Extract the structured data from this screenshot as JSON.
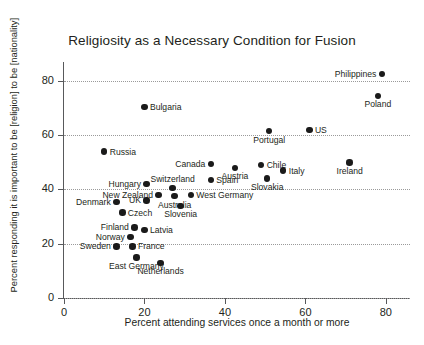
{
  "chart_data": {
    "type": "scatter",
    "title": "Religiosity as a Necessary Condition for Fusion",
    "xlabel": "Percent attending services once a month or more",
    "ylabel": "Percent responding it is important to be [religion] to be [nationality]",
    "xlim": [
      0,
      86
    ],
    "ylim": [
      0,
      87
    ],
    "xticks": [
      0,
      20,
      40,
      60,
      80
    ],
    "yticks": [
      0,
      20,
      40,
      60,
      80
    ],
    "xtick_labels": [
      "0",
      "20",
      "40",
      "60",
      "80"
    ],
    "ytick_labels": [
      "0",
      "20",
      "40",
      "60",
      "80"
    ],
    "grid": "horizontal-dotted",
    "legend": "none",
    "points": [
      {
        "label": "Philippines",
        "x": 79.0,
        "y": 82.5,
        "pos": "left"
      },
      {
        "label": "Poland",
        "x": 78.0,
        "y": 74.5,
        "pos": "below"
      },
      {
        "label": "Bulgaria",
        "x": 20.0,
        "y": 70.5,
        "pos": "right"
      },
      {
        "label": "US",
        "x": 61.0,
        "y": 62.0,
        "pos": "right"
      },
      {
        "label": "Portugal",
        "x": 51.0,
        "y": 61.5,
        "pos": "below"
      },
      {
        "label": "Russia",
        "x": 10.0,
        "y": 54.0,
        "pos": "right"
      },
      {
        "label": "Canada",
        "x": 36.5,
        "y": 49.5,
        "pos": "left"
      },
      {
        "label": "Austria",
        "x": 42.5,
        "y": 48.0,
        "pos": "below"
      },
      {
        "label": "Chile",
        "x": 49.0,
        "y": 49.0,
        "pos": "right"
      },
      {
        "label": "Italy",
        "x": 54.5,
        "y": 47.0,
        "pos": "right"
      },
      {
        "label": "Ireland",
        "x": 71.0,
        "y": 50.0,
        "pos": "below"
      },
      {
        "label": "Slovakia",
        "x": 50.5,
        "y": 44.0,
        "pos": "below"
      },
      {
        "label": "Spain",
        "x": 36.5,
        "y": 43.5,
        "pos": "right"
      },
      {
        "label": "Hungary",
        "x": 20.5,
        "y": 42.0,
        "pos": "left"
      },
      {
        "label": "Switzerland",
        "x": 27.0,
        "y": 40.5,
        "pos": "above"
      },
      {
        "label": "New Zealand",
        "x": 23.5,
        "y": 38.0,
        "pos": "left"
      },
      {
        "label": "UK",
        "x": 20.5,
        "y": 36.0,
        "pos": "left"
      },
      {
        "label": "Australia",
        "x": 27.5,
        "y": 37.5,
        "pos": "below"
      },
      {
        "label": "West Germany",
        "x": 31.5,
        "y": 38.0,
        "pos": "right"
      },
      {
        "label": "Denmark",
        "x": 13.0,
        "y": 35.5,
        "pos": "left"
      },
      {
        "label": "Slovenia",
        "x": 29.0,
        "y": 34.0,
        "pos": "below"
      },
      {
        "label": "Czech",
        "x": 14.5,
        "y": 31.5,
        "pos": "right"
      },
      {
        "label": "Finland",
        "x": 17.5,
        "y": 26.0,
        "pos": "left"
      },
      {
        "label": "Latvia",
        "x": 20.0,
        "y": 25.0,
        "pos": "right"
      },
      {
        "label": "Norway",
        "x": 16.5,
        "y": 22.5,
        "pos": "left"
      },
      {
        "label": "Sweden",
        "x": 13.0,
        "y": 19.0,
        "pos": "left"
      },
      {
        "label": "France",
        "x": 17.0,
        "y": 19.0,
        "pos": "right"
      },
      {
        "label": "East Germany",
        "x": 18.0,
        "y": 15.0,
        "pos": "below"
      },
      {
        "label": "Netherlands",
        "x": 24.0,
        "y": 13.0,
        "pos": "below"
      }
    ]
  }
}
